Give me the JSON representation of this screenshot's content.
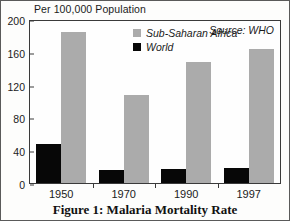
{
  "chart_data": {
    "type": "bar",
    "title": "",
    "caption": "Figure 1: Malaria Mortality Rate",
    "axis_title": "Per 100,000 Population",
    "xlabel": "",
    "ylabel": "Per 100,000 Population",
    "categories": [
      "1950",
      "1970",
      "1990",
      "1997"
    ],
    "series": [
      {
        "name": "World",
        "color": "#070707",
        "values": [
          48,
          16,
          17,
          18
        ]
      },
      {
        "name": "Sub-Saharan Africa",
        "color": "#ababab",
        "values": [
          184,
          107,
          148,
          164
        ]
      }
    ],
    "ylim": [
      0,
      200
    ],
    "yticks": [
      0,
      40,
      80,
      120,
      160,
      200
    ],
    "ytick_labels": [
      "0",
      "40",
      "80",
      "120",
      "160",
      "200"
    ],
    "grid": false,
    "legend_position": "upper-center-inside",
    "annotations": [
      {
        "text": "Source: WHO",
        "position": "upper-right-inside"
      }
    ]
  },
  "legend": {
    "items": [
      {
        "label": "Sub-Saharan Africa",
        "color": "#ababab"
      },
      {
        "label": "World",
        "color": "#070707"
      }
    ]
  },
  "source": {
    "text": "Source: WHO"
  },
  "colors": {
    "world": "#070707",
    "africa": "#ababab",
    "axis": "#3a3a3a",
    "text": "#1b1b1b",
    "background": "#fdfdfc"
  }
}
